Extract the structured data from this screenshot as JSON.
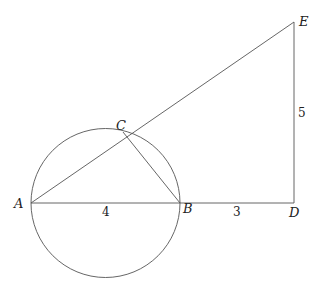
{
  "diagram": {
    "type": "geometry",
    "points": {
      "A": {
        "label": "A",
        "x": 31,
        "y": 203
      },
      "B": {
        "label": "B",
        "x": 180,
        "y": 203
      },
      "C": {
        "label": "C",
        "x": 123,
        "y": 132
      },
      "D": {
        "label": "D",
        "x": 294,
        "y": 203
      },
      "E": {
        "label": "E",
        "x": 294,
        "y": 22
      }
    },
    "circle": {
      "center_x": 105.5,
      "center_y": 203,
      "radius": 74.5,
      "diameter": "AB"
    },
    "segments": [
      "AB",
      "BD",
      "DE",
      "AE",
      "CB"
    ],
    "lengths": {
      "AB": "4",
      "BD": "3",
      "DE": "5"
    }
  }
}
